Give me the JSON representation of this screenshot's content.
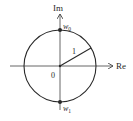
{
  "diagram": {
    "type": "complex-plane-unit-circle",
    "axes": {
      "x_label": "Re",
      "y_label": "Im"
    },
    "origin_label": "0",
    "radius_label": "1",
    "points": [
      {
        "label_base": "w",
        "label_sub": "0",
        "position": "top of circle (0, 1)"
      },
      {
        "label_base": "w",
        "label_sub": "1",
        "position": "bottom of circle (0, -1)"
      }
    ],
    "colors": {
      "stroke": "#2a2a2a",
      "axis": "#555555",
      "background": "#ffffff"
    }
  }
}
